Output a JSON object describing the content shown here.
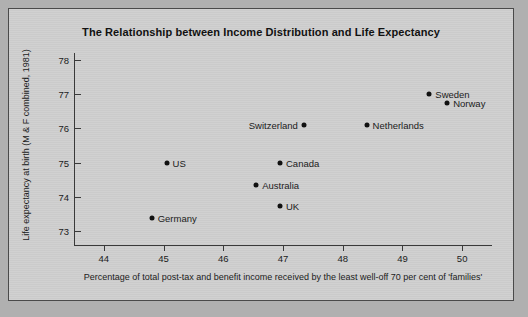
{
  "figure": {
    "title": "The Relationship between Income Distribution and Life Expectancy"
  },
  "chart_data": {
    "type": "scatter",
    "title": "The Relationship between Income Distribution and Life Expectancy",
    "xlabel": "Percentage of total post-tax and benefit income received by the least well-off 70 per cent of 'families'",
    "ylabel": "Life expectancy at birth (M & F combined, 1981)",
    "xlim": [
      43.5,
      50.5
    ],
    "ylim": [
      72.6,
      78.2
    ],
    "xticks": [
      44,
      45,
      46,
      47,
      48,
      49,
      50
    ],
    "xtick_labels": [
      "44",
      "45",
      "46",
      "47",
      "48",
      "49",
      "50"
    ],
    "yticks": [
      73,
      74,
      75,
      76,
      77,
      78
    ],
    "ytick_labels": [
      "73",
      "74",
      "75",
      "76",
      "77",
      "78"
    ],
    "grid": false,
    "legend": "none",
    "marker_color": "#111111",
    "points": [
      {
        "label": "Sweden",
        "x": 49.45,
        "y": 77.0,
        "label_side": "right"
      },
      {
        "label": "Norway",
        "x": 49.75,
        "y": 76.75,
        "label_side": "right"
      },
      {
        "label": "Netherlands",
        "x": 48.4,
        "y": 76.1,
        "label_side": "right"
      },
      {
        "label": "Switzerland",
        "x": 47.35,
        "y": 76.1,
        "label_side": "left"
      },
      {
        "label": "Canada",
        "x": 46.95,
        "y": 75.0,
        "label_side": "right"
      },
      {
        "label": "US",
        "x": 45.05,
        "y": 75.0,
        "label_side": "right"
      },
      {
        "label": "Australia",
        "x": 46.55,
        "y": 74.35,
        "label_side": "right"
      },
      {
        "label": "UK",
        "x": 46.95,
        "y": 73.75,
        "label_side": "right"
      },
      {
        "label": "Germany",
        "x": 44.8,
        "y": 73.4,
        "label_side": "right"
      }
    ]
  }
}
